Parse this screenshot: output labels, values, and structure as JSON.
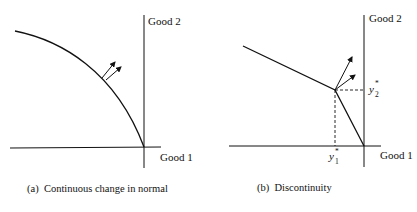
{
  "panels": [
    {
      "id": "a",
      "caption": "(a)  Continuous change in normal",
      "x_axis_label": "Good 1",
      "y_axis_label": "Good 2",
      "frontier_type": "smooth concave curve",
      "normals": 2
    },
    {
      "id": "b",
      "caption": "(b)  Discontinuity",
      "x_axis_label": "Good 1",
      "y_axis_label": "Good 2",
      "frontier_type": "kinked piecewise linear",
      "normals": 2,
      "kink_x_label": "y",
      "kink_x_sub": "1",
      "kink_x_sup": "*",
      "kink_y_label": "y",
      "kink_y_sub": "2",
      "kink_y_sup": "*"
    }
  ],
  "colors": {
    "ink": "#111111",
    "background": "#ffffff"
  }
}
